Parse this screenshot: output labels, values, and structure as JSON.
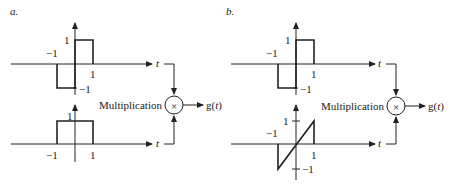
{
  "panels": [
    {
      "label": "a.",
      "top_signal": {
        "name": "odd square pulse",
        "points": [
          [
            -1,
            0
          ],
          [
            -1,
            -1
          ],
          [
            0,
            -1
          ],
          [
            0,
            1
          ],
          [
            1,
            1
          ],
          [
            1,
            0
          ]
        ]
      },
      "bottom_signal": {
        "name": "rectangular pulse",
        "points": [
          [
            -1,
            0
          ],
          [
            -1,
            1
          ],
          [
            1,
            1
          ],
          [
            1,
            0
          ]
        ]
      }
    },
    {
      "label": "b.",
      "top_signal": {
        "name": "odd square pulse",
        "points": [
          [
            -1,
            0
          ],
          [
            -1,
            -1
          ],
          [
            0,
            -1
          ],
          [
            0,
            1
          ],
          [
            1,
            1
          ],
          [
            1,
            0
          ]
        ]
      },
      "bottom_signal": {
        "name": "ramp",
        "points": [
          [
            -1,
            0
          ],
          [
            -1,
            -1
          ],
          [
            1,
            1
          ],
          [
            1,
            0
          ]
        ]
      }
    }
  ],
  "labels": {
    "t": "t",
    "one": "1",
    "neg_one": "−1",
    "multiplication": "Multiplication",
    "times": "×",
    "output": "g(t)",
    "output_g": "g(",
    "output_t": "t",
    "output_close": ")"
  }
}
